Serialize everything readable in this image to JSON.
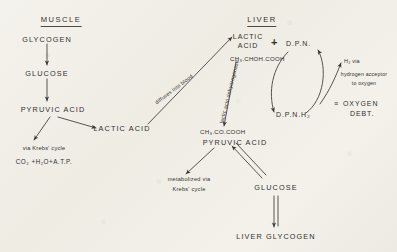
{
  "diagram": {
    "title_muscle": "MUSCLE",
    "title_liver": "LIVER",
    "muscle": {
      "glycogen": "GLYCOGEN",
      "glucose": "GLUCOSE",
      "pyruvic_acid": "PYRUVIC ACID",
      "lactic_acid": "LACTIC ACID",
      "krebs_note": "via Krebs' cycle",
      "krebs_products": "CO₂ +H₂O+A.T.P."
    },
    "transport": {
      "diffuses": "diffuses into blood"
    },
    "liver": {
      "lactic_acid_line1": "LACTIC",
      "lactic_acid_line2": "ACID",
      "lactic_formula": "CH₃.CHOH.COOH",
      "plus": "+",
      "dpn": "D.P.N.",
      "dpnh2": "D.P.N.H₂",
      "enzyme": "lactic acid dehydrogenase",
      "pyruvic_formula": "CH₃.CO.COOH",
      "pyruvic_acid": "PYRUVIC ACID",
      "hydrogen_line1": "H₂ via",
      "hydrogen_line2": "hydrogen acceptor",
      "hydrogen_line3": "to oxygen",
      "oxygen_debt_symbol": "≡",
      "oxygen_debt_line1": "OXYGEN",
      "oxygen_debt_line2": "DEBT.",
      "metabolized_line1": "metabolized via",
      "metabolized_line2": "Krebs' cycle",
      "glucose": "GLUCOSE",
      "liver_glycogen": "LIVER GLYCOGEN"
    },
    "colors": {
      "ink": "#31302e",
      "paper": "#f2f0ea",
      "line": "#3a3936"
    }
  }
}
